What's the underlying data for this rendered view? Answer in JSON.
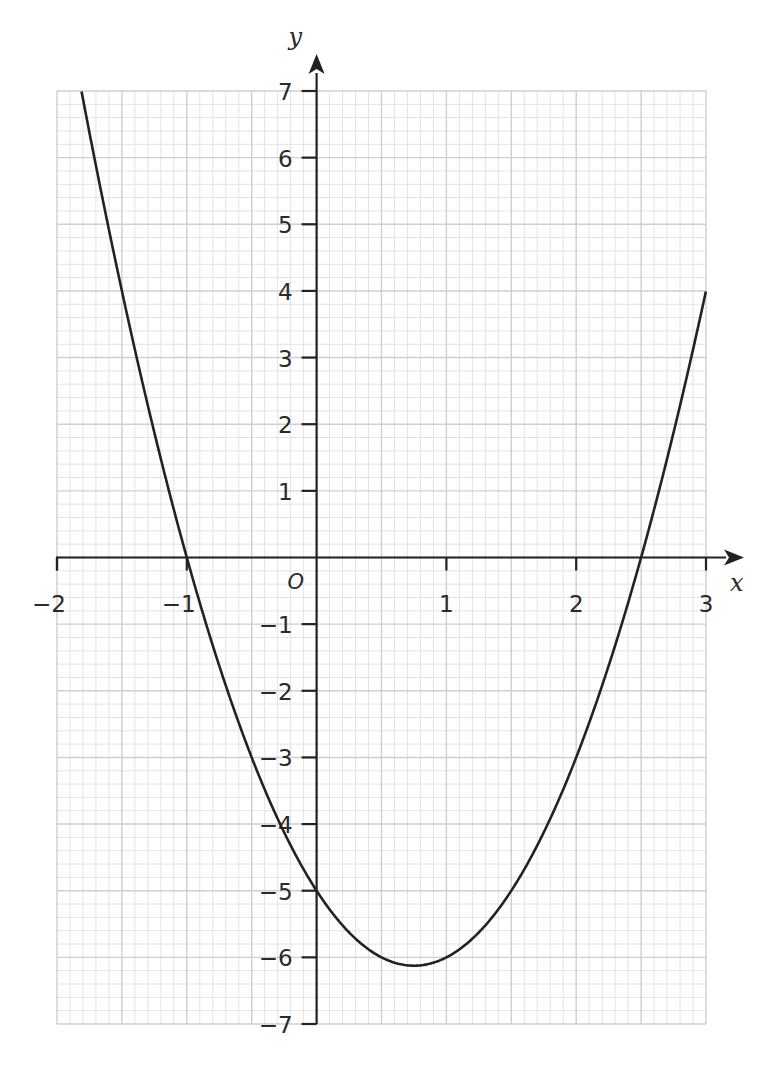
{
  "chart_data": {
    "type": "line",
    "title": "",
    "xlabel": "x",
    "ylabel": "y",
    "origin_label": "O",
    "xlim": [
      -2,
      3
    ],
    "ylim": [
      -7,
      7
    ],
    "grid": true,
    "grid_minor_x": 0.1,
    "grid_minor_y": 0.2,
    "grid_major_x": 0.5,
    "grid_major_y": 1,
    "x_ticks": [
      -2,
      -1,
      1,
      2,
      3
    ],
    "x_tick_labels": [
      "−2",
      "−1",
      "1",
      "2",
      "3"
    ],
    "y_ticks": [
      7,
      6,
      5,
      4,
      3,
      2,
      1,
      -1,
      -2,
      -3,
      -4,
      -5,
      -6,
      -7
    ],
    "y_tick_labels": [
      "7",
      "6",
      "5",
      "4",
      "3",
      "2",
      "1",
      "−1",
      "−2",
      "−3",
      "−4",
      "−5",
      "−6",
      "−7"
    ],
    "series": [
      {
        "name": "y = 2x² − 3x − 5",
        "color": "#222222",
        "x": [
          -1.75,
          -1.5,
          -1.25,
          -1.0,
          -0.75,
          -0.5,
          -0.25,
          0.0,
          0.25,
          0.5,
          0.75,
          1.0,
          1.25,
          1.5,
          1.75,
          2.0,
          2.25,
          2.5,
          2.75,
          3.0
        ],
        "y": [
          6.375,
          4.0,
          1.875,
          0.0,
          -1.625,
          -3.0,
          -4.125,
          -5.0,
          -5.625,
          -6.0,
          -6.125,
          -6.0,
          -5.625,
          -5.0,
          -4.125,
          -3.0,
          -1.625,
          0.0,
          1.875,
          4.0
        ]
      }
    ],
    "annotations": {
      "roots": [
        -1,
        2.5
      ],
      "y_intercept": -5,
      "minimum": [
        0.75,
        -6.125
      ]
    }
  },
  "colors": {
    "curve": "#222222",
    "axes": "#222222",
    "grid_minor": "#e3e3e3",
    "grid_major": "#cfcfcf",
    "text": "#2a2a2a"
  }
}
